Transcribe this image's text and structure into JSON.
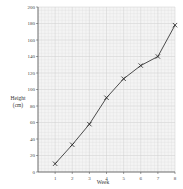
{
  "chart_data": {
    "type": "line",
    "title": "",
    "xlabel": "Week",
    "ylabel": "Height",
    "ylabel_unit": "(cm)",
    "x": [
      1,
      2,
      3,
      4,
      5,
      6,
      7,
      8
    ],
    "categories": [
      "1",
      "2",
      "3",
      "4",
      "5",
      "6",
      "7",
      "8"
    ],
    "series": [
      {
        "name": "Height",
        "values": [
          10,
          33,
          58,
          90,
          113,
          129,
          140,
          178
        ],
        "marker": "x",
        "color": "#222222"
      }
    ],
    "xlim": [
      0,
      8
    ],
    "ylim": [
      0,
      200
    ],
    "yticks": [
      0,
      20,
      40,
      60,
      80,
      100,
      120,
      140,
      160,
      180,
      200
    ],
    "xticks": [
      1,
      2,
      3,
      4,
      5,
      6,
      7,
      8
    ],
    "grid": true,
    "grid_color": "#d8d8d8",
    "legend": null
  }
}
